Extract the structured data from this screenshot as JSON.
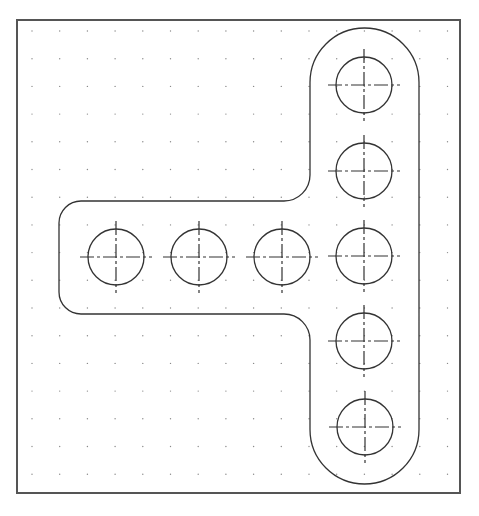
{
  "drawing": {
    "type": "cad-part-drawing",
    "description": "T-shaped plate with rounded ends and filleted inner corners, showing 8 circular holes with dash-dot centerlines on a dot grid",
    "canvas": {
      "width": 479,
      "height": 516,
      "background": "#ffffff"
    },
    "frame": {
      "x": 17,
      "y": 20,
      "width": 443,
      "height": 473,
      "stroke": "#555555",
      "stroke_width": 2
    },
    "grid": {
      "type": "dots",
      "origin_x": 32,
      "origin_y": 31,
      "spacing": 27.7,
      "dot_radius": 0.7,
      "color": "#8a8a8a"
    },
    "outline": {
      "stroke": "#333333",
      "stroke_width": 1.3,
      "vertical_arm": {
        "left_x": 310,
        "right_x": 419,
        "top_y": 28,
        "bottom_y": 484,
        "end_radius": 54.5
      },
      "horizontal_arm": {
        "left_x": 59,
        "top_y": 201,
        "bottom_y": 314,
        "outer_corner_radius": 22
      },
      "inner_fillet_radius": 26
    },
    "holes": {
      "radius": 28,
      "stroke": "#333333",
      "centerline_overhang": 8,
      "centerline_dash": "14 3 3 3",
      "items": [
        {
          "id": "H1",
          "cx": 364,
          "cy": 85
        },
        {
          "id": "H2",
          "cx": 364,
          "cy": 171
        },
        {
          "id": "H3",
          "cx": 116,
          "cy": 257
        },
        {
          "id": "H4",
          "cx": 199,
          "cy": 257
        },
        {
          "id": "H5",
          "cx": 282,
          "cy": 257
        },
        {
          "id": "H6",
          "cx": 364,
          "cy": 256
        },
        {
          "id": "H7",
          "cx": 364,
          "cy": 341
        },
        {
          "id": "H8",
          "cx": 365,
          "cy": 427
        }
      ]
    },
    "hole_count": 8
  },
  "captions": {
    "top": "",
    "bottom": ""
  }
}
